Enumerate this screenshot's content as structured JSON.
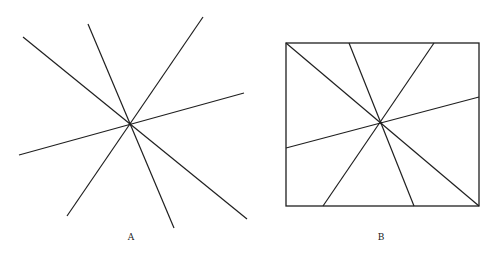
{
  "colors": {
    "stroke": "#1f1f1f",
    "background": "#ffffff",
    "label": "#222222"
  },
  "figures": [
    {
      "id": "A",
      "label": "A",
      "label_pos": [
        131,
        240
      ],
      "center": [
        130,
        124
      ],
      "lines": [
        [
          23,
          37,
          247,
          219
        ],
        [
          88,
          24,
          174,
          228
        ],
        [
          203,
          17,
          67,
          216
        ],
        [
          244,
          93,
          19,
          155
        ]
      ]
    },
    {
      "id": "B",
      "label": "B",
      "label_pos": [
        381,
        240
      ],
      "center": [
        381,
        123
      ],
      "frame": {
        "x": 286,
        "y": 43,
        "width": 193,
        "height": 163
      },
      "lines": [
        [
          286,
          43,
          479,
          206
        ],
        [
          349,
          43,
          414,
          206
        ],
        [
          434,
          43,
          323,
          206
        ],
        [
          479,
          97,
          286,
          148
        ]
      ]
    }
  ]
}
